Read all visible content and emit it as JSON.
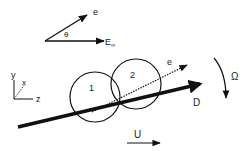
{
  "diagram": {
    "top_vectors": {
      "e_label": "e",
      "theta_label": "θ",
      "E_label": "E",
      "E_subscript": "∞"
    },
    "axes": {
      "y_label": "y",
      "x_label": "x",
      "z_label": "z"
    },
    "particles": [
      {
        "label": "1"
      },
      {
        "label": "2"
      }
    ],
    "doublet_axis_label": "e",
    "rod_label": "D",
    "rotation_label": "Ω",
    "velocity_label": "U",
    "colors": {
      "ink": "#111111",
      "background": "#ffffff"
    }
  }
}
